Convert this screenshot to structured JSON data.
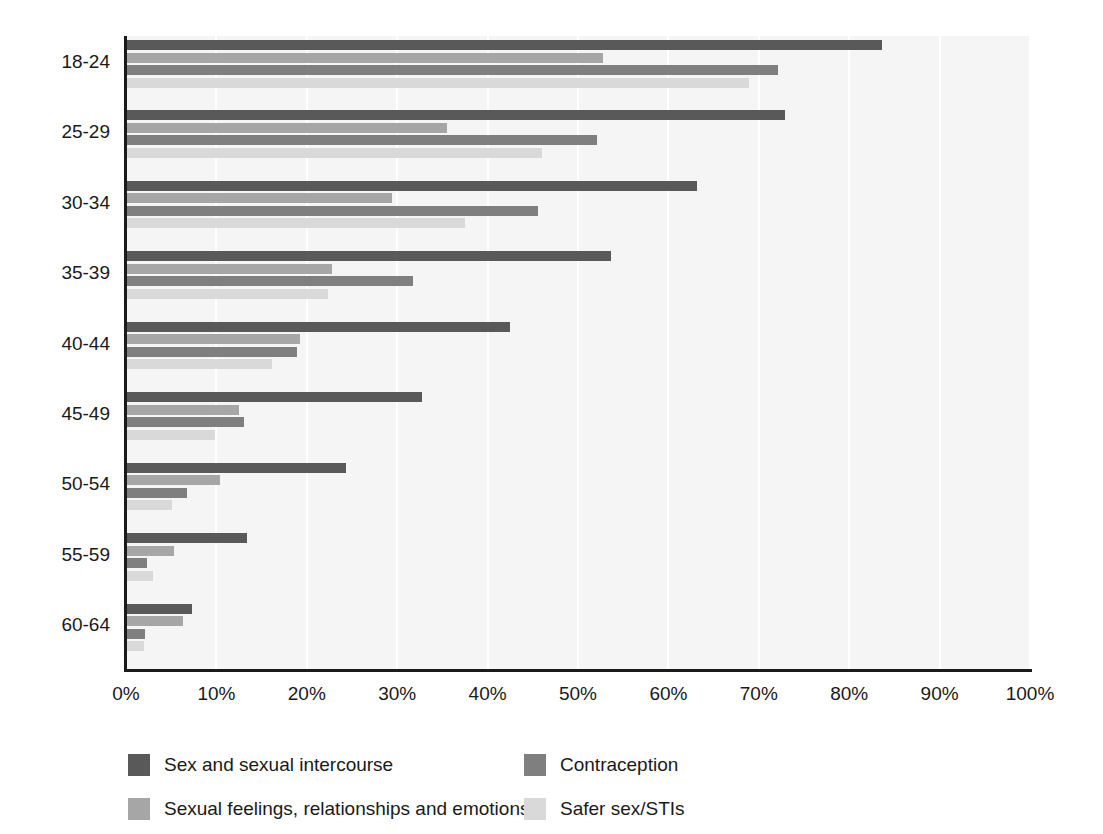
{
  "chart_data": {
    "type": "bar",
    "orientation": "horizontal",
    "title": "",
    "subtitle": "",
    "xlabel": "",
    "ylabel": "",
    "xlim": [
      0,
      100
    ],
    "grid": true,
    "legend_position": "bottom",
    "categories": [
      "18-24",
      "25-29",
      "30-34",
      "35-39",
      "40-44",
      "45-49",
      "50-54",
      "55-59",
      "60-64"
    ],
    "xticks": [
      "0%",
      "10%",
      "20%",
      "30%",
      "40%",
      "50%",
      "60%",
      "70%",
      "80%",
      "90%",
      "100%"
    ],
    "xtick_values": [
      0,
      10,
      20,
      30,
      40,
      50,
      60,
      70,
      80,
      90,
      100
    ],
    "series": [
      {
        "name": "Sex and sexual intercourse",
        "color": "#595959",
        "values": [
          83.6,
          72.9,
          63.2,
          53.7,
          42.5,
          32.7,
          24.3,
          13.4,
          7.3
        ]
      },
      {
        "name": "Sexual feelings, relationships and emotions",
        "color": "#a6a6a6",
        "values": [
          52.8,
          35.5,
          29.4,
          22.8,
          19.2,
          12.5,
          10.4,
          5.3,
          6.3
        ]
      },
      {
        "name": "Contraception",
        "color": "#7f7f7f",
        "values": [
          72.1,
          52.1,
          45.6,
          31.8,
          18.9,
          13.1,
          6.8,
          2.3,
          2.1
        ]
      },
      {
        "name": "Safer sex/STIs",
        "color": "#d9d9d9",
        "values": [
          68.9,
          46.0,
          37.5,
          22.4,
          16.2,
          9.8,
          5.1,
          3.0,
          2.0
        ]
      }
    ]
  },
  "legend": {
    "items": [
      {
        "label": "Sex and sexual intercourse",
        "color": "#595959"
      },
      {
        "label": "Contraception",
        "color": "#7f7f7f"
      },
      {
        "label": "Sexual feelings, relationships and emotions",
        "color": "#a6a6a6"
      },
      {
        "label": "Safer sex/STIs",
        "color": "#d9d9d9"
      }
    ]
  }
}
